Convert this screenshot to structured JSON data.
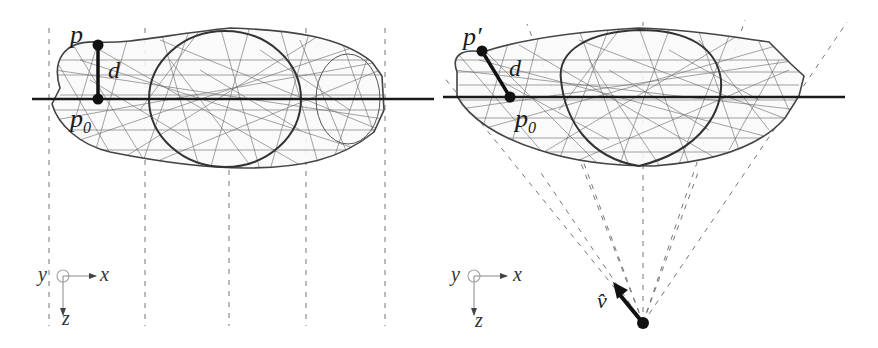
{
  "figure": {
    "type": "projection-diagram",
    "colors": {
      "mesh": "#555555",
      "axis_line": "#1a1a1a",
      "dashed": "#666666",
      "point": "#111111",
      "origin_circle": "#aaaaaa"
    },
    "left_panel": {
      "name": "orthographic-projection",
      "labels": {
        "p": "p",
        "d": "d",
        "p0_base": "p",
        "p0_sub": "0"
      },
      "axes": {
        "y": "y",
        "x": "x",
        "z": "z"
      },
      "projector_style": "parallel-vertical-dashed",
      "projector_count": 5
    },
    "right_panel": {
      "name": "perspective-projection",
      "labels": {
        "p_prime": "p′",
        "d": "d",
        "p0_base": "p",
        "p0_sub": "0",
        "view_vector": "v̂"
      },
      "axes": {
        "y": "y",
        "x": "x",
        "z": "z"
      },
      "projector_style": "converging-dashed-rays",
      "projector_count": 7
    }
  }
}
